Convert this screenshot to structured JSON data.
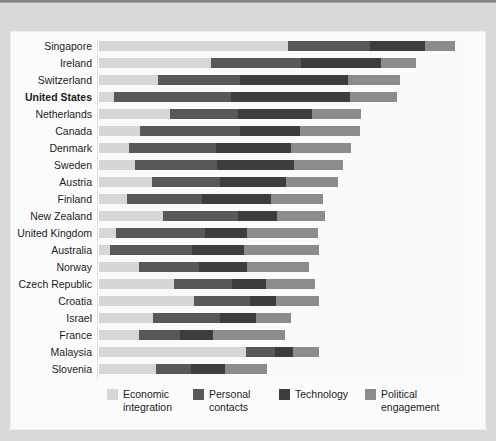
{
  "chart_data": {
    "type": "bar",
    "orientation": "horizontal",
    "stacked": true,
    "title": "",
    "subtitle": "",
    "xlabel": "",
    "ylabel": "",
    "grid": false,
    "legend_position": "bottom",
    "xlim": [
      0,
      100
    ],
    "axis_ticks_visible": false,
    "categories": [
      "Singapore",
      "Ireland",
      "Switzerland",
      "United States",
      "Netherlands",
      "Canada",
      "Denmark",
      "Sweden",
      "Austria",
      "Finland",
      "New Zealand",
      "United Kingdom",
      "Australia",
      "Norway",
      "Czech Republic",
      "Croatia",
      "Israel",
      "France",
      "Malaysia",
      "Slovenia"
    ],
    "highlighted_category": "United States",
    "series": [
      {
        "name": "Economic integration",
        "color": "#d6d6d6",
        "values": [
          50.6,
          30.0,
          15.9,
          3.9,
          19.0,
          11.1,
          8.0,
          9.6,
          14.1,
          7.6,
          17.2,
          4.5,
          2.9,
          10.6,
          20.2,
          25.4,
          14.4,
          10.8,
          39.3,
          15.4
        ]
      },
      {
        "name": "Personal contacts",
        "color": "#585858",
        "values": [
          22.1,
          24.1,
          21.9,
          31.5,
          18.3,
          26.6,
          23.5,
          22.1,
          18.3,
          19.9,
          20.1,
          23.8,
          22.1,
          16.3,
          15.4,
          15.1,
          18.0,
          11.0,
          7.9,
          9.4
        ]
      },
      {
        "name": "Technology",
        "color": "#3d3d3d",
        "values": [
          14.6,
          21.6,
          29.0,
          32.0,
          19.9,
          16.3,
          19.9,
          20.5,
          17.8,
          18.6,
          10.5,
          11.4,
          13.8,
          12.9,
          9.1,
          6.9,
          9.8,
          8.8,
          4.8,
          8.9
        ]
      },
      {
        "name": "Political engagement",
        "color": "#8c8c8c",
        "values": [
          8.1,
          9.4,
          13.8,
          12.6,
          13.1,
          16.0,
          16.3,
          13.3,
          13.8,
          13.9,
          12.7,
          19.0,
          20.3,
          16.4,
          13.1,
          11.6,
          9.3,
          19.4,
          7.0,
          11.3
        ]
      }
    ],
    "totals": [
      95.4,
      85.1,
      80.6,
      80.0,
      70.3,
      70.0,
      67.7,
      65.5,
      64.0,
      60.0,
      60.5,
      58.7,
      59.1,
      56.2,
      57.8,
      59.0,
      51.5,
      50.0,
      59.0,
      45.0
    ]
  },
  "legend": {
    "items": [
      {
        "label_line1": "Economic",
        "label_line2": "integration",
        "color": "#d6d6d6",
        "swatch_name": "legend-swatch-economic-integration"
      },
      {
        "label_line1": "Personal",
        "label_line2": "contacts",
        "color": "#585858",
        "swatch_name": "legend-swatch-personal-contacts"
      },
      {
        "label_line1": "Technology",
        "label_line2": "",
        "color": "#3d3d3d",
        "swatch_name": "legend-swatch-technology"
      },
      {
        "label_line1": "Political",
        "label_line2": "engagement",
        "color": "#8c8c8c",
        "swatch_name": "legend-swatch-political-engagement"
      }
    ]
  }
}
